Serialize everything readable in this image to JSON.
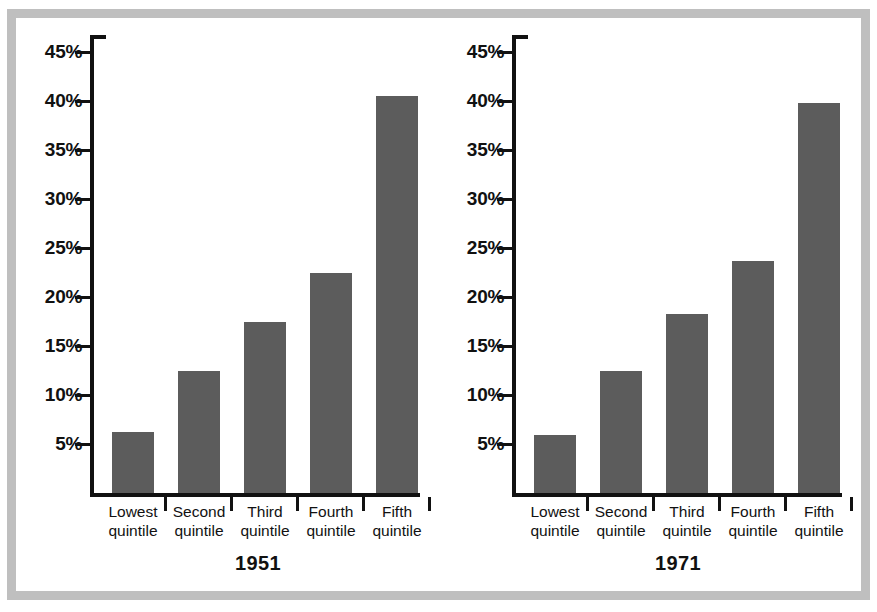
{
  "figure": {
    "frame_color": "#bfbfbf",
    "background": "#ffffff",
    "bar_color": "#5c5c5c",
    "axis_color": "#111111"
  },
  "chart_data": [
    {
      "type": "bar",
      "title": "1951",
      "xlabel": "",
      "ylabel": "",
      "categories": [
        "Lowest quintile",
        "Second quintile",
        "Third quintile",
        "Fourth quintile",
        "Fifth quintile"
      ],
      "category_lines": [
        [
          "Lowest",
          "quintile"
        ],
        [
          "Second",
          "quintile"
        ],
        [
          "Third",
          "quintile"
        ],
        [
          "Fourth",
          "quintile"
        ],
        [
          "Fifth",
          "quintile"
        ]
      ],
      "values": [
        6.2,
        12.5,
        17.5,
        22.5,
        40.5
      ],
      "ylim": [
        0,
        48
      ],
      "yticks": [
        5,
        10,
        15,
        20,
        25,
        30,
        35,
        40,
        45
      ],
      "ytick_labels": [
        "5%",
        "10%",
        "15%",
        "20%",
        "25%",
        "30%",
        "35%",
        "40%",
        "45%"
      ],
      "grid": false,
      "legend": "none"
    },
    {
      "type": "bar",
      "title": "1971",
      "xlabel": "",
      "ylabel": "",
      "categories": [
        "Lowest quintile",
        "Second quintile",
        "Third quintile",
        "Fourth quintile",
        "Fifth quintile"
      ],
      "category_lines": [
        [
          "Lowest",
          "quintile"
        ],
        [
          "Second",
          "quintile"
        ],
        [
          "Third",
          "quintile"
        ],
        [
          "Fourth",
          "quintile"
        ],
        [
          "Fifth",
          "quintile"
        ]
      ],
      "values": [
        5.9,
        12.5,
        18.3,
        23.7,
        39.8
      ],
      "ylim": [
        0,
        48
      ],
      "yticks": [
        5,
        10,
        15,
        20,
        25,
        30,
        35,
        40,
        45
      ],
      "ytick_labels": [
        "5%",
        "10%",
        "15%",
        "20%",
        "25%",
        "30%",
        "35%",
        "40%",
        "45%"
      ],
      "grid": false,
      "legend": "none"
    }
  ]
}
